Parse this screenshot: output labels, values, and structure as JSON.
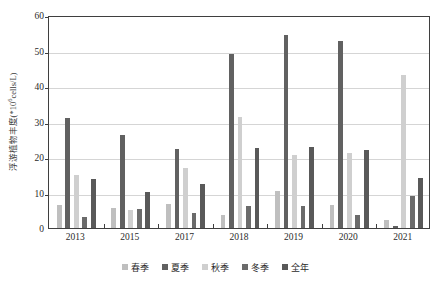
{
  "chart_data": {
    "type": "bar",
    "title": "",
    "subtitle": "",
    "xlabel": "",
    "ylabel": "浮游植物丰度(*10⁶cells/L)",
    "ylabel_base": "浮游植物丰度(*10",
    "ylabel_sup": "6",
    "ylabel_tail": "cells/L)",
    "ylim": [
      0,
      60
    ],
    "ytick_step": 10,
    "yticks": [
      0,
      10,
      20,
      30,
      40,
      50,
      60
    ],
    "ytick_labels": [
      "0",
      "10",
      "20",
      "30",
      "40",
      "50",
      "60"
    ],
    "grid": "horizontal",
    "legend_position": "bottom",
    "categories": [
      "2013",
      "2015",
      "2017",
      "2018",
      "2019",
      "2020",
      "2021"
    ],
    "xtick_labels": [
      "2013",
      "2015",
      "2017",
      "2018",
      "2019",
      "2020",
      "2021"
    ],
    "series": [
      {
        "name": "春季",
        "color": "#bfbfbf",
        "values": [
          6.6,
          5.6,
          6.9,
          3.8,
          10.3,
          6.5,
          2.2
        ]
      },
      {
        "name": "夏季",
        "color": "#616161",
        "values": [
          31.0,
          26.1,
          22.3,
          48.9,
          54.4,
          52.7,
          0.7
        ]
      },
      {
        "name": "秋季",
        "color": "#cfcfcf",
        "values": [
          14.8,
          5.0,
          16.8,
          31.3,
          20.6,
          21.1,
          43.0
        ]
      },
      {
        "name": "冬季",
        "color": "#6b6b6b",
        "values": [
          3.1,
          5.4,
          4.3,
          6.3,
          6.2,
          3.6,
          8.9
        ]
      },
      {
        "name": "全年",
        "color": "#595959",
        "values": [
          13.8,
          10.2,
          12.4,
          22.6,
          22.8,
          21.9,
          14.2
        ]
      }
    ]
  },
  "legend": {
    "items": [
      {
        "label": "春季",
        "color": "#bfbfbf"
      },
      {
        "label": "夏季",
        "color": "#616161"
      },
      {
        "label": "秋季",
        "color": "#cfcfcf"
      },
      {
        "label": "冬季",
        "color": "#6b6b6b"
      },
      {
        "label": "全年",
        "color": "#595959"
      }
    ]
  },
  "style": {
    "axis_color": "#3f3f3f",
    "grid_color": "#d5d5d5",
    "background": "#ffffff",
    "text_color": "#2b2b2b"
  }
}
